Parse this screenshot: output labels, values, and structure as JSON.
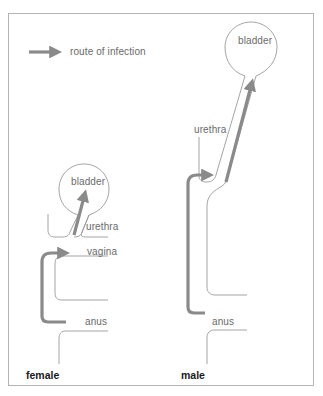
{
  "legend": {
    "label": "route of infection",
    "icon": "arrow-right-icon"
  },
  "female": {
    "title": "female",
    "labels": {
      "bladder": "bladder",
      "urethra": "urethra",
      "vagina": "vagina",
      "anus": "anus"
    }
  },
  "male": {
    "title": "male",
    "labels": {
      "bladder": "bladder",
      "urethra": "urethra",
      "anus": "anus"
    }
  },
  "colors": {
    "frame": "#b4b4b4",
    "outline": "#9a9a9a",
    "arrow": "#8a8a8a",
    "arrow_edge": "#6e6e6e",
    "label": "#6a6a6a",
    "title": "#1a1a1a"
  }
}
